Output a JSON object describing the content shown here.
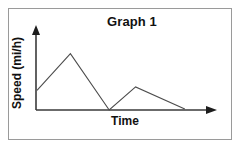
{
  "figure": {
    "title": "Graph 1",
    "frame_color": "#9a9a9a",
    "background": "#ffffff"
  },
  "axes": {
    "x_label": "Time",
    "y_label": "Speed (mi/h)",
    "axis_color": "#3a3a3a",
    "x_arrow": "arrow-right",
    "y_arrow": "arrow-up"
  },
  "chart_data": {
    "type": "line",
    "title": "Graph 1",
    "xlabel": "Time",
    "ylabel": "Speed (mi/h)",
    "x": [
      0,
      1.9,
      4.1,
      5.6,
      8.4
    ],
    "y": [
      3.5,
      10,
      0,
      4.1,
      0.2
    ],
    "series": [
      {
        "name": "Speed",
        "values": [
          3.5,
          10,
          0,
          4.1,
          0.2
        ],
        "color": "#4c4c4c"
      }
    ],
    "xlim": [
      0,
      10
    ],
    "ylim": [
      0,
      11
    ],
    "grid": false,
    "legend": "none",
    "xticks": [],
    "yticks": [],
    "xticklabels": [],
    "yticklabels": [],
    "annotations": []
  }
}
